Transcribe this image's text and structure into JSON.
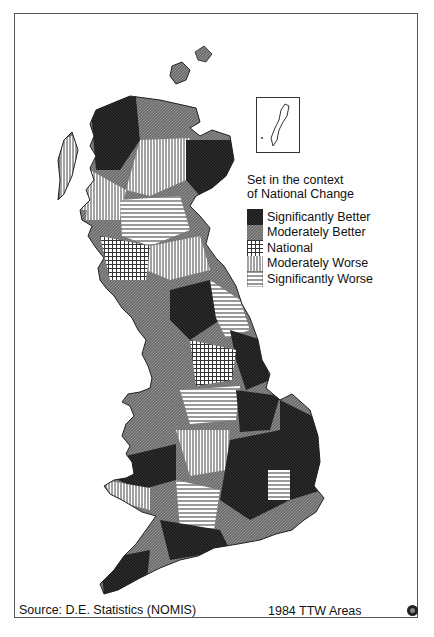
{
  "map": {
    "region": "Great Britain",
    "subject": "Travel-to-Work Areas change in the context of national change",
    "inset": {
      "label": "Shetland Islands inset"
    }
  },
  "legend": {
    "title_line1": "Set in the context",
    "title_line2": "of National Change",
    "items": [
      {
        "label": "Significantly Better",
        "pattern": "dark-crosshatch",
        "color": "#1a1a1a"
      },
      {
        "label": "Moderately Better",
        "pattern": "grey-dense-hatch",
        "color": "#7a7a7a"
      },
      {
        "label": "National",
        "pattern": "grid-hatch",
        "color": "#b5b5b5"
      },
      {
        "label": "Moderately Worse",
        "pattern": "vertical-lines",
        "color": "#d0d0d0"
      },
      {
        "label": "Significantly Worse",
        "pattern": "horizontal-lines",
        "color": "#ffffff"
      }
    ]
  },
  "footer": {
    "source": "Source: D.E. Statistics (NOMIS)",
    "areas": "1984 TTW Areas"
  }
}
